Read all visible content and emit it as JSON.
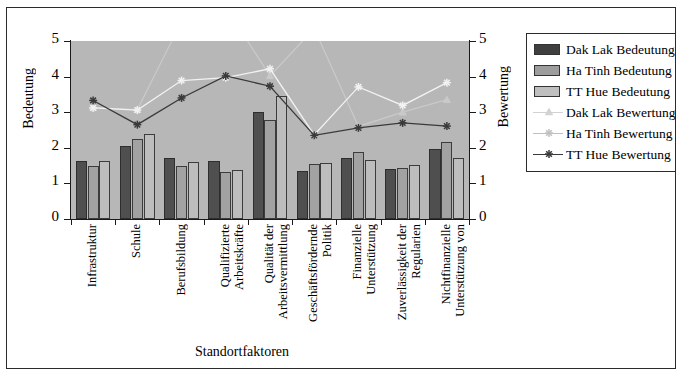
{
  "chart_data": {
    "type": "bar",
    "title": "",
    "xlabel": "Standortfaktoren",
    "ylabel": "Bedeutung",
    "ylabel_right": "Bewertung",
    "ylim": [
      0,
      5
    ],
    "ylim_right": [
      0,
      5
    ],
    "yticks": [
      0,
      1,
      2,
      3,
      4,
      5
    ],
    "yticks_right": [
      0,
      1,
      2,
      3,
      4,
      5
    ],
    "grid": false,
    "legend_position": "right",
    "plot_background": "#b7b7b7",
    "categories": [
      "Infrastruktur",
      "Schule",
      "Berufsbildung",
      "Qualifizierte Arbeitskräfte",
      "Qualität der Arbeitsvermittlung",
      "Geschäftsfördernde Politik",
      "Finanzielle Unterstützung",
      "Zuverlässigkeit der Regularien",
      "Nichtfinanzielle Unterstützung von"
    ],
    "category_lines": [
      [
        "Infrastruktur"
      ],
      [
        "Schule"
      ],
      [
        "Berufsbildung"
      ],
      [
        "Qualifizierte",
        "Arbeitskräfte"
      ],
      [
        "Qualität der",
        "Arbeitsvermittlung"
      ],
      [
        "Geschäftsfördernde",
        "Politik"
      ],
      [
        "Finanzielle",
        "Unterstützung"
      ],
      [
        "Zuverlässigkeit der",
        "Regularien"
      ],
      [
        "Nichtfinanzielle",
        "Unterstützung von"
      ]
    ],
    "series": [
      {
        "name": "Dak Lak Bedeutung",
        "type": "bar",
        "color": "#4f4f4f",
        "axis": "left",
        "values": [
          1.62,
          2.06,
          1.71,
          1.64,
          3.01,
          1.34,
          1.72,
          1.41,
          1.96
        ]
      },
      {
        "name": "Ha Tinh Bedeutung",
        "type": "bar",
        "color": "#a2a2a2",
        "axis": "left",
        "values": [
          1.49,
          2.24,
          1.5,
          1.31,
          2.79,
          1.55,
          1.87,
          1.43,
          2.16
        ]
      },
      {
        "name": "TT Hue Bedeutung",
        "type": "bar",
        "color": "#bdbdbd",
        "axis": "left",
        "values": [
          1.62,
          2.4,
          1.61,
          1.39,
          3.45,
          1.57,
          1.66,
          1.53,
          1.7
        ]
      },
      {
        "name": "Dak Lak Bewertung",
        "type": "line",
        "color": "#c9c9c9",
        "axis": "right",
        "marker": "triangle",
        "values": [
          3.13,
          3.07,
          5.55,
          5.95,
          4.02,
          5.35,
          2.6,
          3.0,
          3.35
        ]
      },
      {
        "name": "Ha Tinh Bewertung",
        "type": "line",
        "color": "#f2f2f2",
        "axis": "right",
        "marker": "star",
        "values": [
          3.12,
          3.06,
          3.89,
          3.97,
          4.22,
          2.36,
          3.71,
          3.19,
          3.83
        ]
      },
      {
        "name": "TT Hue Bewertung",
        "type": "line",
        "color": "#3a3a3a",
        "axis": "right",
        "marker": "star",
        "values": [
          3.33,
          2.65,
          3.4,
          4.02,
          3.73,
          2.35,
          2.56,
          2.7,
          2.61
        ]
      }
    ]
  },
  "legend": {
    "items": [
      {
        "label": "Dak Lak Bedeutung",
        "kind": "swatch",
        "swatch_class": "s1"
      },
      {
        "label": "Ha Tinh Bedeutung",
        "kind": "swatch",
        "swatch_class": "s2"
      },
      {
        "label": "TT Hue Bedeutung",
        "kind": "swatch",
        "swatch_class": "s3"
      },
      {
        "label": "Dak Lak Bewertung",
        "kind": "line",
        "color": "#d2d2d2",
        "marker": "triangle"
      },
      {
        "label": "Ha Tinh Bewertung",
        "kind": "line",
        "color": "#c0c0c0",
        "marker": "star"
      },
      {
        "label": "TT Hue Bewertung",
        "kind": "line",
        "color": "#3a3a3a",
        "marker": "star"
      }
    ]
  }
}
